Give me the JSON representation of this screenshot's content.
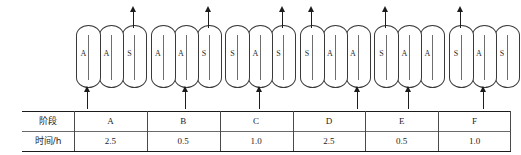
{
  "diagram": {
    "groups": [
      {
        "id": "group-a",
        "capsules": [
          {
            "label": "A"
          },
          {
            "label": "A"
          },
          {
            "label": "S"
          }
        ],
        "inlet_arrow": {
          "name": "inlet-arrow",
          "position": "left",
          "direction": "up"
        },
        "outlet_arrow": {
          "name": "outlet-arrow",
          "position": "right",
          "direction": "up"
        }
      },
      {
        "id": "group-b",
        "capsules": [
          {
            "label": "A"
          },
          {
            "label": "A"
          },
          {
            "label": "S"
          }
        ],
        "inlet_arrow": {
          "name": "inlet-arrow",
          "position": "middle",
          "direction": "up"
        },
        "outlet_arrow": {
          "name": "outlet-arrow",
          "position": "right",
          "direction": "up"
        }
      },
      {
        "id": "group-c",
        "capsules": [
          {
            "label": "S"
          },
          {
            "label": "A"
          },
          {
            "label": "S"
          }
        ],
        "inlet_arrow": {
          "name": "inlet-arrow",
          "position": "middle",
          "direction": "up"
        },
        "outlet_arrow": {
          "name": "outlet-arrow",
          "position": "right",
          "direction": "up"
        }
      },
      {
        "id": "group-d",
        "capsules": [
          {
            "label": "S"
          },
          {
            "label": "A"
          },
          {
            "label": "A"
          }
        ],
        "inlet_arrow": {
          "name": "inlet-arrow",
          "position": "right",
          "direction": "up"
        },
        "outlet_arrow": {
          "name": "outlet-arrow",
          "position": "left",
          "direction": "up"
        }
      },
      {
        "id": "group-e",
        "capsules": [
          {
            "label": "S"
          },
          {
            "label": "A"
          },
          {
            "label": "A"
          }
        ],
        "inlet_arrow": {
          "name": "inlet-arrow",
          "position": "middle",
          "direction": "up"
        },
        "outlet_arrow": {
          "name": "outlet-arrow",
          "position": "left",
          "direction": "up"
        }
      },
      {
        "id": "group-f",
        "capsules": [
          {
            "label": "S"
          },
          {
            "label": "A"
          },
          {
            "label": "S"
          }
        ],
        "inlet_arrow": {
          "name": "inlet-arrow",
          "position": "middle",
          "direction": "up"
        },
        "outlet_arrow": {
          "name": "outlet-arrow",
          "position": "left",
          "direction": "up"
        }
      }
    ]
  },
  "table": {
    "rows": [
      {
        "header": "阶段",
        "cells": [
          "A",
          "B",
          "C",
          "D",
          "E",
          "F"
        ]
      },
      {
        "header": "时间/h",
        "cells": [
          "2.5",
          "0.5",
          "1.0",
          "2.5",
          "0.5",
          "1.0"
        ]
      }
    ]
  },
  "colors": {
    "line": "#1c1c1c",
    "capsule_stroke": "#3a3a3a",
    "stick": "#6e6e6e",
    "text": "#1d1d1d",
    "background": "#ffffff"
  }
}
